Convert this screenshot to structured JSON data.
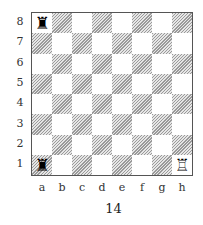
{
  "diagram": {
    "caption": "14",
    "files": [
      "a",
      "b",
      "c",
      "d",
      "e",
      "f",
      "g",
      "h"
    ],
    "ranks": [
      "8",
      "7",
      "6",
      "5",
      "4",
      "3",
      "2",
      "1"
    ],
    "pieces": [
      {
        "square": "a8",
        "piece": "rook",
        "color": "black",
        "glyph": "♜"
      },
      {
        "square": "a1",
        "piece": "rook",
        "color": "black",
        "glyph": "♜"
      },
      {
        "square": "h1",
        "piece": "rook",
        "color": "white",
        "glyph": "♖"
      }
    ],
    "colors": {
      "dark_square_hatch": "#9a9a9a",
      "light_square": "#ffffff",
      "border": "#555555"
    }
  }
}
